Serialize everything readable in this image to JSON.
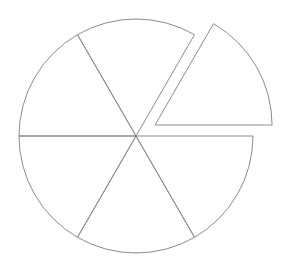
{
  "figure": {
    "title": "",
    "background_color": "#ffffff",
    "width": 288,
    "height": 261
  },
  "chart_data": {
    "type": "pie",
    "title": "",
    "subtitle": "",
    "xlabel": "",
    "ylabel": "",
    "labels": [
      "",
      "",
      "",
      "",
      "",
      ""
    ],
    "values": [
      1,
      1,
      1,
      1,
      1,
      1
    ],
    "percentages": [
      16.67,
      16.67,
      16.67,
      16.67,
      16.67,
      16.67
    ],
    "slice_angles_deg": [
      60,
      60,
      60,
      60,
      60,
      60
    ],
    "start_angle_deg": 0,
    "direction": "counterclockwise",
    "legend": "none",
    "grid": false,
    "annotations": [],
    "geometry": {
      "center_x": 136,
      "center_y": 136,
      "radius": 117,
      "slice_boundaries_deg": [
        0,
        60,
        120,
        180,
        240,
        300,
        360
      ]
    },
    "slices": [
      {
        "index": 0,
        "name": "slice-right-upper-exploded",
        "start_deg": 0,
        "end_deg": 60,
        "value": 1,
        "percent": 16.67,
        "exploded": true,
        "explode_offset": 22,
        "explode_direction_deg": 30,
        "fill": "none",
        "stroke": "#8c8c8c"
      },
      {
        "index": 1,
        "name": "slice-top-right",
        "start_deg": 60,
        "end_deg": 120,
        "value": 1,
        "percent": 16.67,
        "exploded": false,
        "explode_offset": 0,
        "explode_direction_deg": 90,
        "fill": "none",
        "stroke": "#8c8c8c"
      },
      {
        "index": 2,
        "name": "slice-top-left",
        "start_deg": 120,
        "end_deg": 180,
        "value": 1,
        "percent": 16.67,
        "exploded": false,
        "explode_offset": 0,
        "explode_direction_deg": 150,
        "fill": "none",
        "stroke": "#8c8c8c"
      },
      {
        "index": 3,
        "name": "slice-bottom-left",
        "start_deg": 180,
        "end_deg": 240,
        "value": 1,
        "percent": 16.67,
        "exploded": false,
        "explode_offset": 0,
        "explode_direction_deg": 210,
        "fill": "none",
        "stroke": "#8c8c8c"
      },
      {
        "index": 4,
        "name": "slice-bottom",
        "start_deg": 240,
        "end_deg": 300,
        "value": 1,
        "percent": 16.67,
        "exploded": false,
        "explode_offset": 0,
        "explode_direction_deg": 270,
        "fill": "none",
        "stroke": "#8c8c8c"
      },
      {
        "index": 5,
        "name": "slice-bottom-right",
        "start_deg": 300,
        "end_deg": 360,
        "value": 1,
        "percent": 16.67,
        "exploded": false,
        "explode_offset": 0,
        "explode_direction_deg": 330,
        "fill": "none",
        "stroke": "#8c8c8c"
      }
    ],
    "style": {
      "stroke_color": "#8c8c8c",
      "stroke_width": 1,
      "fill_color": "none"
    }
  }
}
